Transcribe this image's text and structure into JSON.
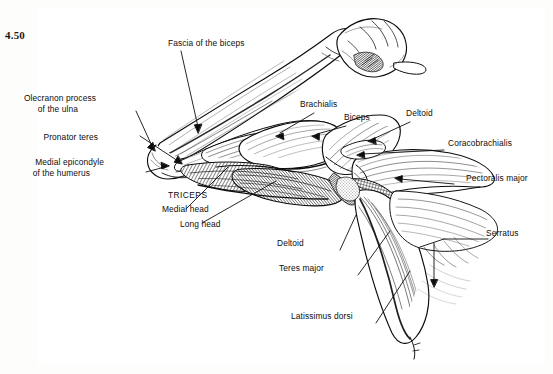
{
  "figure": {
    "number": "4.50",
    "kind": "anatomical-illustration",
    "style": "black and white pen-and-ink engraving",
    "frame_color": "#9a9a9a",
    "ink_color": "#0d0d0d",
    "paper_color": "#ffffff"
  },
  "labels": {
    "fascia_of_the_biceps": "Fascia of the biceps",
    "olecranon_process_l1": "Olecranon process",
    "olecranon_process_l2": "of the ulna",
    "pronator_teres": "Pronator teres",
    "medial_epicondyle_l1": "Medial epicondyle",
    "medial_epicondyle_l2": "of the humerus",
    "triceps": "TRICEPS",
    "medial_head": "Medial head",
    "long_head": "Long head",
    "brachialis": "Brachialis",
    "biceps": "Biceps",
    "deltoid_upper": "Deltoid",
    "deltoid_lower": "Deltoid",
    "coracobrachialis": "Coracobrachialis",
    "pectoralis_major": "Pectoralis major",
    "serratus": "Serratus",
    "teres_major": "Teres major",
    "latissimus_dorsi": "Latissimus dorsi"
  }
}
